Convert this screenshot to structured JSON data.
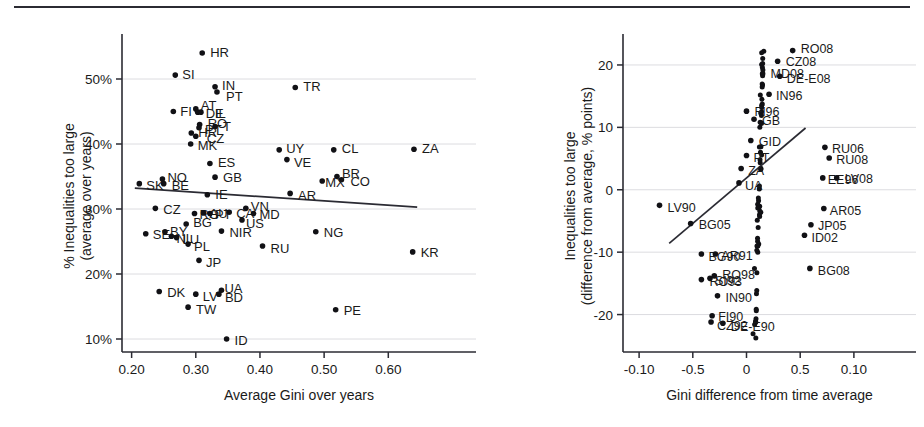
{
  "figure": {
    "title": "",
    "panel_count": 2
  },
  "chart_data": [
    {
      "type": "scatter",
      "panel": "left",
      "title": "",
      "xlabel": "Average Gini over years",
      "ylabel": "% Inequalities too large\n(average over years)",
      "ylabel_line1": "% Inequalities too large",
      "ylabel_line2": "(average over years)",
      "xlim": [
        0.185,
        0.665
      ],
      "ylim": [
        8.0,
        56.0
      ],
      "xticks": [
        0.2,
        0.3,
        0.4,
        0.5,
        0.6
      ],
      "xticklabels": [
        "0.20",
        "0.30",
        "0.40",
        "0.50",
        "0.60"
      ],
      "yticks": [
        10,
        20,
        30,
        40,
        50
      ],
      "yticklabels": [
        "10%",
        "20%",
        "30%",
        "40%",
        "50%"
      ],
      "grid": "horizontal",
      "legend": "none",
      "trendline": {
        "x": [
          0.205,
          0.645
        ],
        "y": [
          33.2,
          30.3
        ],
        "note": "downward sloping fitted line"
      },
      "points": [
        {
          "label": "HR",
          "x": 0.31,
          "y": 54.0,
          "lx": 8,
          "ly": -1
        },
        {
          "label": "SI",
          "x": 0.268,
          "y": 50.6,
          "lx": 7,
          "ly": -1
        },
        {
          "label": "IN",
          "x": 0.33,
          "y": 48.8,
          "lx": 7,
          "ly": -1
        },
        {
          "label": "PT",
          "x": 0.333,
          "y": 48.0,
          "lx": 9,
          "ly": 4
        },
        {
          "label": "TR",
          "x": 0.455,
          "y": 48.7,
          "lx": 8,
          "ly": -1
        },
        {
          "label": "FI",
          "x": 0.265,
          "y": 45.0,
          "lx": 7,
          "ly": 0
        },
        {
          "label": "AT",
          "x": 0.3,
          "y": 45.4,
          "lx": 5,
          "ly": -3
        },
        {
          "label": "DE",
          "x": 0.303,
          "y": 44.9,
          "lx": 8,
          "ly": 1
        },
        {
          "label": "IL",
          "x": 0.308,
          "y": 44.9,
          "lx": 14,
          "ly": 1
        },
        {
          "label": "RO",
          "x": 0.306,
          "y": 43.0,
          "lx": 8,
          "ly": -1
        },
        {
          "label": "PT",
          "x": 0.305,
          "y": 42.5,
          "lx": 6,
          "ly": 2
        },
        {
          "label": "T",
          "x": 0.33,
          "y": 42.7,
          "lx": 8,
          "ly": 0
        },
        {
          "label": "HR",
          "x": 0.293,
          "y": 41.7,
          "lx": 7,
          "ly": 0
        },
        {
          "label": "CZ",
          "x": 0.3,
          "y": 41.2,
          "lx": 11,
          "ly": 2
        },
        {
          "label": "MK",
          "x": 0.292,
          "y": 40.0,
          "lx": 7,
          "ly": 1
        },
        {
          "label": "ES",
          "x": 0.322,
          "y": 37.0,
          "lx": 8,
          "ly": -1
        },
        {
          "label": "UY",
          "x": 0.43,
          "y": 39.1,
          "lx": 7,
          "ly": -1
        },
        {
          "label": "VE",
          "x": 0.442,
          "y": 37.6,
          "lx": 7,
          "ly": 3
        },
        {
          "label": "CL",
          "x": 0.515,
          "y": 39.1,
          "lx": 8,
          "ly": -1
        },
        {
          "label": "ZA",
          "x": 0.64,
          "y": 39.2,
          "lx": 8,
          "ly": -1
        },
        {
          "label": "GB",
          "x": 0.33,
          "y": 34.9,
          "lx": 8,
          "ly": 0
        },
        {
          "label": "SK",
          "x": 0.212,
          "y": 33.9,
          "lx": 7,
          "ly": 2
        },
        {
          "label": "NO",
          "x": 0.248,
          "y": 34.6,
          "lx": 5,
          "ly": -2
        },
        {
          "label": "BE",
          "x": 0.25,
          "y": 33.9,
          "lx": 8,
          "ly": 2
        },
        {
          "label": "BR",
          "x": 0.52,
          "y": 35.0,
          "lx": 5,
          "ly": -3
        },
        {
          "label": "CO",
          "x": 0.527,
          "y": 34.5,
          "lx": 9,
          "ly": 2
        },
        {
          "label": "MX",
          "x": 0.497,
          "y": 34.3,
          "lx": 3,
          "ly": 1
        },
        {
          "label": "AR",
          "x": 0.447,
          "y": 32.4,
          "lx": 8,
          "ly": 2
        },
        {
          "label": "IE",
          "x": 0.318,
          "y": 32.2,
          "lx": 8,
          "ly": 0
        },
        {
          "label": "CZ",
          "x": 0.237,
          "y": 30.1,
          "lx": 8,
          "ly": 1
        },
        {
          "label": "RO",
          "x": 0.298,
          "y": 29.3,
          "lx": 5,
          "ly": 1
        },
        {
          "label": "AU",
          "x": 0.312,
          "y": 29.4,
          "lx": 6,
          "ly": 1
        },
        {
          "label": "PT",
          "x": 0.322,
          "y": 29.3,
          "lx": 5,
          "ly": 1
        },
        {
          "label": "CA",
          "x": 0.352,
          "y": 29.5,
          "lx": 7,
          "ly": 1
        },
        {
          "label": "VN",
          "x": 0.378,
          "y": 30.1,
          "lx": 5,
          "ly": -2
        },
        {
          "label": "MD",
          "x": 0.39,
          "y": 29.3,
          "lx": 6,
          "ly": 1
        },
        {
          "label": "US",
          "x": 0.372,
          "y": 28.3,
          "lx": 4,
          "ly": 3
        },
        {
          "label": "BG",
          "x": 0.285,
          "y": 27.7,
          "lx": 7,
          "ly": -1
        },
        {
          "label": "NIR",
          "x": 0.34,
          "y": 26.6,
          "lx": 8,
          "ly": 1
        },
        {
          "label": "SE",
          "x": 0.222,
          "y": 26.2,
          "lx": 7,
          "ly": 1
        },
        {
          "label": "BY",
          "x": 0.252,
          "y": 26.5,
          "lx": 5,
          "ly": 0
        },
        {
          "label": "NL",
          "x": 0.262,
          "y": 25.8,
          "lx": 5,
          "ly": 2
        },
        {
          "label": "LU",
          "x": 0.27,
          "y": 25.6,
          "lx": 6,
          "ly": 2
        },
        {
          "label": "PL",
          "x": 0.288,
          "y": 24.6,
          "lx": 6,
          "ly": 2
        },
        {
          "label": "RU",
          "x": 0.404,
          "y": 24.3,
          "lx": 8,
          "ly": 2
        },
        {
          "label": "NG",
          "x": 0.487,
          "y": 26.5,
          "lx": 8,
          "ly": 1
        },
        {
          "label": "KR",
          "x": 0.638,
          "y": 23.4,
          "lx": 8,
          "ly": 1
        },
        {
          "label": "JP",
          "x": 0.305,
          "y": 22.1,
          "lx": 7,
          "ly": 2
        },
        {
          "label": "DK",
          "x": 0.243,
          "y": 17.3,
          "lx": 8,
          "ly": 1
        },
        {
          "label": "LV",
          "x": 0.3,
          "y": 16.9,
          "lx": 7,
          "ly": 2
        },
        {
          "label": "UA",
          "x": 0.34,
          "y": 17.5,
          "lx": 3,
          "ly": -2
        },
        {
          "label": "BD",
          "x": 0.336,
          "y": 16.9,
          "lx": 6,
          "ly": 3
        },
        {
          "label": "TW",
          "x": 0.288,
          "y": 14.9,
          "lx": 8,
          "ly": 2
        },
        {
          "label": "PE",
          "x": 0.518,
          "y": 14.5,
          "lx": 8,
          "ly": 1
        },
        {
          "label": "ID",
          "x": 0.348,
          "y": 10.0,
          "lx": 8,
          "ly": 1
        }
      ]
    },
    {
      "type": "scatter",
      "panel": "right",
      "title": "",
      "xlabel": "Gini difference from time average",
      "ylabel": "Inequalities too large\n(difference from average, % points)",
      "ylabel_line1": "Inequalities too large",
      "ylabel_line2": "(difference from average, % points)",
      "xlim": [
        -0.115,
        0.115
      ],
      "ylim": [
        -26.0,
        24.0
      ],
      "xticks": [
        -0.1,
        -0.05,
        0.0,
        0.05,
        0.1
      ],
      "xticklabels": [
        "-0.10",
        "-0.5",
        "0",
        "0.5",
        "0.10"
      ],
      "yticks": [
        -20,
        -10,
        0,
        10,
        20
      ],
      "yticklabels": [
        "-20",
        "-10",
        "0",
        "10",
        "20"
      ],
      "grid": "horizontal",
      "legend": "none",
      "trendline": {
        "x": [
          -0.072,
          0.055
        ],
        "y": [
          -8.6,
          9.9
        ],
        "note": "upward sloping fitted line through dense cloud"
      },
      "cloud": {
        "note": "dense overplotted cluster of country-year points",
        "center_x": 0.012,
        "center_y": 1.0,
        "count": 430
      },
      "points": [
        {
          "label": "RO08",
          "x": 0.043,
          "y": 22.3,
          "lx": 8,
          "ly": -2
        },
        {
          "label": "CZ08",
          "x": 0.029,
          "y": 20.6,
          "lx": 8,
          "ly": 0
        },
        {
          "label": "MD08",
          "x": 0.015,
          "y": 18.6,
          "lx": 8,
          "ly": 0
        },
        {
          "label": "DE-E08",
          "x": 0.031,
          "y": 18.2,
          "lx": 7,
          "ly": 2
        },
        {
          "label": "IN96",
          "x": 0.021,
          "y": 15.3,
          "lx": 7,
          "ly": 1
        },
        {
          "label": "FI96",
          "x": 0.0,
          "y": 12.6,
          "lx": 8,
          "ly": 0
        },
        {
          "label": "GB",
          "x": 0.007,
          "y": 11.3,
          "lx": 8,
          "ly": 1
        },
        {
          "label": "GID",
          "x": 0.004,
          "y": 7.9,
          "lx": 8,
          "ly": 1
        },
        {
          "label": "PT",
          "x": 0.0,
          "y": 5.5,
          "lx": 7,
          "ly": 2
        },
        {
          "label": "RU06",
          "x": 0.073,
          "y": 6.8,
          "lx": 7,
          "ly": 1
        },
        {
          "label": "RU08",
          "x": 0.077,
          "y": 5.1,
          "lx": 7,
          "ly": 2
        },
        {
          "label": "ZA",
          "x": -0.005,
          "y": 3.4,
          "lx": 7,
          "ly": 2
        },
        {
          "label": "EE96",
          "x": 0.071,
          "y": 1.9,
          "lx": 5,
          "ly": 2
        },
        {
          "label": "LV08",
          "x": 0.084,
          "y": 1.9,
          "lx": 8,
          "ly": 1
        },
        {
          "label": "UA",
          "x": -0.007,
          "y": 1.1,
          "lx": 6,
          "ly": 3
        },
        {
          "label": "AR05",
          "x": 0.072,
          "y": -3.0,
          "lx": 6,
          "ly": 2
        },
        {
          "label": "LV90",
          "x": -0.081,
          "y": -2.5,
          "lx": 8,
          "ly": 2
        },
        {
          "label": "JP05",
          "x": 0.06,
          "y": -5.6,
          "lx": 7,
          "ly": 1
        },
        {
          "label": "BG05",
          "x": -0.052,
          "y": -5.4,
          "lx": 8,
          "ly": 1
        },
        {
          "label": "ID02",
          "x": 0.054,
          "y": -7.3,
          "lx": 7,
          "ly": 2
        },
        {
          "label": "BG90",
          "x": -0.042,
          "y": -10.3,
          "lx": 7,
          "ly": 2
        },
        {
          "label": "AR91",
          "x": -0.029,
          "y": -10.3,
          "lx": 6,
          "ly": 1
        },
        {
          "label": "BG08",
          "x": 0.059,
          "y": -12.6,
          "lx": 8,
          "ly": 2
        },
        {
          "label": "RO93",
          "x": -0.042,
          "y": -14.4,
          "lx": 8,
          "ly": 2
        },
        {
          "label": "SI92",
          "x": -0.034,
          "y": -14.2,
          "lx": 5,
          "ly": 2
        },
        {
          "label": "RO98",
          "x": -0.03,
          "y": -13.8,
          "lx": 8,
          "ly": -1
        },
        {
          "label": "IN90",
          "x": -0.027,
          "y": -17.0,
          "lx": 8,
          "ly": 2
        },
        {
          "label": "FI90",
          "x": -0.032,
          "y": -20.2,
          "lx": 6,
          "ly": 1
        },
        {
          "label": "CZ92",
          "x": -0.033,
          "y": -21.2,
          "lx": 6,
          "ly": 3
        },
        {
          "label": "DE-E90",
          "x": -0.022,
          "y": -21.4,
          "lx": 8,
          "ly": 3
        }
      ]
    }
  ]
}
